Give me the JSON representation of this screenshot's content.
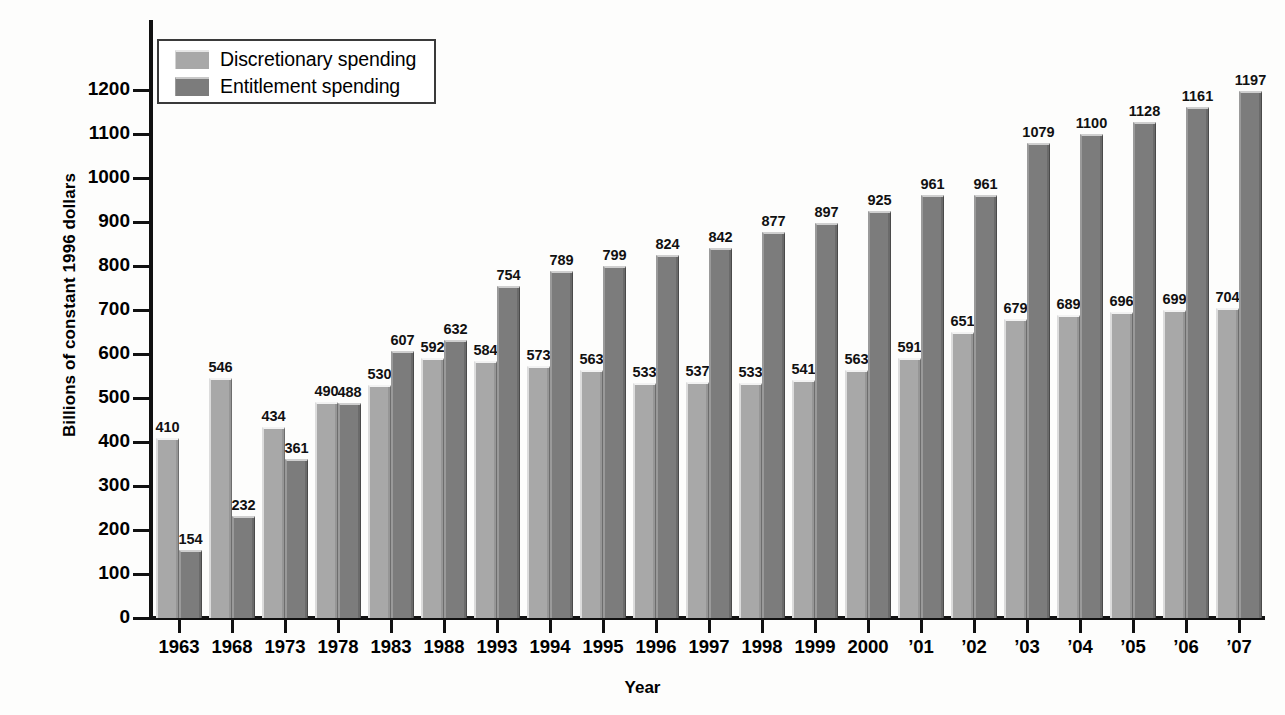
{
  "chart_data": {
    "type": "bar",
    "title": "",
    "xlabel": "Year",
    "ylabel": "Billions of constant 1996 dollars",
    "ylim": [
      0,
      1250
    ],
    "y_ticks": [
      0,
      100,
      200,
      300,
      400,
      500,
      600,
      700,
      800,
      900,
      1000,
      1100,
      1200
    ],
    "grid": false,
    "legend_position": "top-left",
    "categories": [
      "1963",
      "1968",
      "1973",
      "1978",
      "1983",
      "1988",
      "1993",
      "1994",
      "1995",
      "1996",
      "1997",
      "1998",
      "1999",
      "2000",
      "’01",
      "’02",
      "’03",
      "’04",
      "’05",
      "’06",
      "’07"
    ],
    "series": [
      {
        "name": "Discretionary spending",
        "color": "#a8a8a8",
        "values": [
          410,
          546,
          434,
          490,
          530,
          592,
          584,
          573,
          563,
          533,
          537,
          533,
          541,
          563,
          591,
          651,
          679,
          689,
          696,
          699,
          704
        ]
      },
      {
        "name": "Entitlement spending",
        "color": "#7c7c7c",
        "values": [
          154,
          232,
          361,
          488,
          607,
          632,
          754,
          789,
          799,
          824,
          842,
          877,
          897,
          925,
          961,
          961,
          1079,
          1100,
          1128,
          1161,
          1197
        ]
      }
    ]
  },
  "legend": {
    "items": [
      {
        "label": "Discretionary spending",
        "swatch": "discretionary"
      },
      {
        "label": "Entitlement spending",
        "swatch": "entitlement"
      }
    ]
  },
  "axes": {
    "y_title": "Billions of constant 1996 dollars",
    "x_title": "Year"
  }
}
